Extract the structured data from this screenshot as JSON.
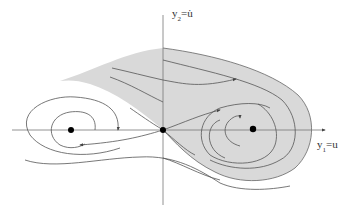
{
  "diagram": {
    "type": "phase-portrait",
    "axes": {
      "vertical": {
        "label_main": "y",
        "label_sub": "2",
        "label_rest": "=u̇"
      },
      "horizontal": {
        "label_main": "y",
        "label_sub": "1",
        "label_rest": "=u"
      }
    },
    "equilibria": [
      {
        "name": "left-center",
        "x": 71,
        "y": 130
      },
      {
        "name": "saddle-origin",
        "x": 163,
        "y": 130
      },
      {
        "name": "right-center",
        "x": 253,
        "y": 129
      }
    ],
    "colors": {
      "shade": "#d9d9d9",
      "line": "#555555",
      "axis": "#777777",
      "dot": "#000000"
    }
  }
}
